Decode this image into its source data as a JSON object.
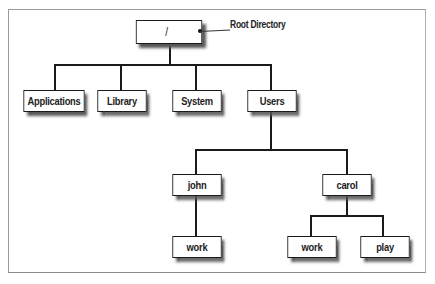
{
  "diagram": {
    "callout": {
      "label": "Root Directory"
    },
    "nodes": {
      "root": "/",
      "applications": "Applications",
      "library": "Library",
      "system": "System",
      "users": "Users",
      "john": "john",
      "carol": "carol",
      "john_work": "work",
      "carol_work": "work",
      "carol_play": "play"
    },
    "colors": {
      "border": "#1a1a1a",
      "shadow": "#555555",
      "background": "#ffffff",
      "frame": "#9a9a9a"
    }
  }
}
